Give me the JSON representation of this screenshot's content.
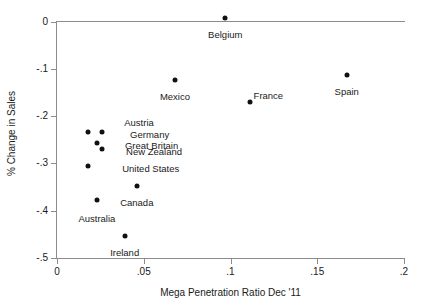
{
  "chart_data": {
    "type": "scatter",
    "title": "",
    "xlabel": "Mega Penetration Ratio Dec '11",
    "ylabel": "% Change in Sales",
    "xlim": [
      0,
      0.2
    ],
    "ylim": [
      -0.5,
      0.0
    ],
    "xticks": [
      "0",
      ".05",
      ".1",
      ".15",
      ".2"
    ],
    "xtick_values": [
      0,
      0.05,
      0.1,
      0.15,
      0.2
    ],
    "yticks": [
      "0",
      "-.1",
      "-.2",
      "-.3",
      "-.4",
      "-.5"
    ],
    "ytick_values": [
      0,
      -0.1,
      -0.2,
      -0.3,
      -0.4,
      -0.5
    ],
    "grid": false,
    "legend": "none",
    "marker_color": "#111111",
    "axis_color": "#8c8c8c",
    "points": [
      {
        "label": "Belgium",
        "x": 0.097,
        "y": 0.008
      },
      {
        "label": "Mexico",
        "x": 0.068,
        "y": -0.124
      },
      {
        "label": "France",
        "x": 0.111,
        "y": -0.17
      },
      {
        "label": "Spain",
        "x": 0.167,
        "y": -0.113
      },
      {
        "label": "Austria",
        "x": 0.018,
        "y": -0.234
      },
      {
        "label": "Germany",
        "x": 0.026,
        "y": -0.234
      },
      {
        "label": "Great Britain",
        "x": 0.023,
        "y": -0.257
      },
      {
        "label": "New Zealand",
        "x": 0.026,
        "y": -0.269
      },
      {
        "label": "United States",
        "x": 0.018,
        "y": -0.305
      },
      {
        "label": "Canada",
        "x": 0.046,
        "y": -0.348
      },
      {
        "label": "Australia",
        "x": 0.023,
        "y": -0.378
      },
      {
        "label": "Ireland",
        "x": 0.039,
        "y": -0.454
      }
    ],
    "cluster_labels": [
      "Austria",
      "Germany",
      "Great Britain",
      "New Zealand",
      "United States"
    ],
    "outside_labels": [
      "Belgium",
      "Mexico",
      "France",
      "Spain",
      "Canada",
      "Australia",
      "Ireland"
    ]
  }
}
